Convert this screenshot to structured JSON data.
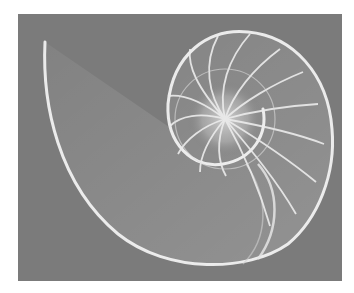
{
  "image": {
    "subject": "Nautilus shell cross-section",
    "style": "grayscale photograph",
    "background_color": "#7b7b7b",
    "page_color": "#ffffff",
    "shell_color": "#e8e8e8"
  }
}
